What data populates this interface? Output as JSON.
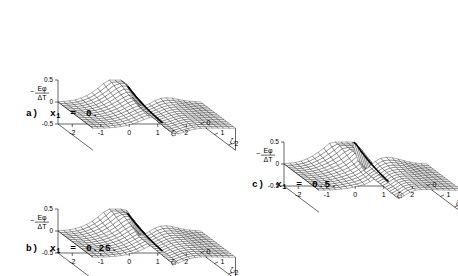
{
  "figure": {
    "type": "multi-panel-3d-surface",
    "panel_count": 3,
    "background_color": "#ffffff",
    "line_color": "#000000"
  },
  "panels": [
    {
      "id": "panel-a",
      "caption_prefix": "a)",
      "caption_var": "x",
      "caption_sub": "1",
      "caption_eq": "=",
      "caption_value": "0.",
      "x1": 0.0
    },
    {
      "id": "panel-b",
      "caption_prefix": "b)",
      "caption_var": "x",
      "caption_sub": "1",
      "caption_eq": "=",
      "caption_value": "0.25.",
      "x1": 0.25
    },
    {
      "id": "panel-c",
      "caption_prefix": "c)",
      "caption_var": "x",
      "caption_sub": "1",
      "caption_eq": "=",
      "caption_value": "0.5.",
      "x1": 0.5
    }
  ],
  "chart_data": [
    {
      "type": "surface",
      "panel": "a",
      "title": "a) x1 = 0.",
      "zlabel_numerator": "Eφ",
      "zlabel_denominator": "ΔT",
      "zlabel_sign": "−",
      "zlabel": "-Eφ/ΔT",
      "xlabel": "ζ₁",
      "ylabel": "ζ₂",
      "xticks": [
        -2,
        -1,
        0,
        1,
        2
      ],
      "xticklabels": [
        "-2",
        "-1",
        "0",
        "1",
        "2"
      ],
      "yticks": [
        0,
        1,
        2
      ],
      "yticklabels": [
        "0",
        "1",
        "2"
      ],
      "zticks": [
        -0.5,
        0,
        0.5
      ],
      "zticklabels": [
        "-0.5",
        "0",
        "0.5"
      ],
      "xlim": [
        -2.5,
        2.5
      ],
      "ylim": [
        0,
        2.5
      ],
      "zlim": [
        -0.5,
        0.5
      ],
      "grid": true,
      "legend": false,
      "mesh_nx": 26,
      "mesh_ny": 16,
      "surface_model": "ridge",
      "params": {
        "x1": 0.0,
        "amp": 0.42,
        "width": 0.3,
        "decay": 0.55,
        "bump": 0.12
      },
      "description": "Wireframe surface with a sharp vertical ridge (discontinuity) near zeta1 = 0, rising to about 0.45 and decaying toward +/-2; a secondary smaller bump on the far side."
    },
    {
      "type": "surface",
      "panel": "b",
      "title": "b) x1 = 0.25.",
      "zlabel_numerator": "Eφ",
      "zlabel_denominator": "ΔT",
      "zlabel_sign": "−",
      "zlabel": "-Eφ/ΔT",
      "xlabel": "ζ₁",
      "ylabel": "ζ₂",
      "xticks": [
        -2,
        -1,
        0,
        1,
        2
      ],
      "xticklabels": [
        "-2",
        "-1",
        "0",
        "1",
        "2"
      ],
      "yticks": [
        0,
        1,
        2
      ],
      "yticklabels": [
        "0",
        "1",
        "2"
      ],
      "zticks": [
        -0.5,
        0,
        0.5
      ],
      "zticklabels": [
        "-0.5",
        "0",
        "0.5"
      ],
      "xlim": [
        -2.5,
        2.5
      ],
      "ylim": [
        0,
        2.5
      ],
      "zlim": [
        -0.5,
        0.5
      ],
      "grid": true,
      "legend": false,
      "mesh_nx": 26,
      "mesh_ny": 16,
      "surface_model": "ridge",
      "params": {
        "x1": 0.25,
        "amp": 0.46,
        "width": 0.26,
        "decay": 0.52,
        "bump": 0.13
      },
      "description": "Same surface family as panel a with a slightly sharper and taller ridge."
    },
    {
      "type": "surface",
      "panel": "c",
      "title": "c) x1 = 0.5.",
      "zlabel_numerator": "Eφ",
      "zlabel_denominator": "ΔT",
      "zlabel_sign": "−",
      "zlabel": "-Eφ/ΔT",
      "xlabel": "ζ₁",
      "ylabel": "ζ₂",
      "xticks": [
        -2,
        -1,
        0,
        1,
        2
      ],
      "xticklabels": [
        "-2",
        "-1",
        "0",
        "1",
        "2"
      ],
      "yticks": [
        0,
        1,
        2
      ],
      "yticklabels": [
        "0",
        "1",
        "2"
      ],
      "zticks": [
        -0.5,
        0,
        0.5
      ],
      "zticklabels": [
        "-0.5",
        "0",
        "0.5"
      ],
      "xlim": [
        -2.5,
        2.5
      ],
      "ylim": [
        0,
        2.5
      ],
      "zlim": [
        -0.5,
        0.5
      ],
      "grid": true,
      "legend": false,
      "mesh_nx": 26,
      "mesh_ny": 16,
      "surface_model": "ridge",
      "params": {
        "x1": 0.5,
        "amp": 0.58,
        "width": 0.2,
        "decay": 0.48,
        "bump": 0.14
      },
      "description": "Same surface family with the tallest, sharpest ridge reaching near the top of the z range."
    }
  ]
}
